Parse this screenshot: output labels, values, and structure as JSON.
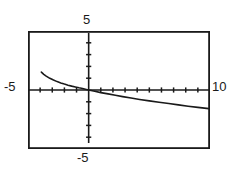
{
  "app": {
    "kind": "graphing-calculator-plot",
    "title": "Graphing calculator plot"
  },
  "labels": {
    "y_max": "5",
    "y_min": "-5",
    "x_min": "-5",
    "x_max": "10"
  },
  "colors": {
    "background": "#ffffff",
    "frame": "#1a1a1a",
    "axis": "#1a1a1a",
    "curve": "#1a1a1a",
    "text": "#1a1a1a"
  },
  "chart_data": {
    "type": "line",
    "title": "",
    "xlabel": "",
    "ylabel": "",
    "xlim": [
      -5,
      10
    ],
    "ylim": [
      -5,
      5
    ],
    "grid": false,
    "legend": "none",
    "axis_ticks": {
      "x_interval": 1,
      "y_interval": 1,
      "x_ticks": [
        -5,
        -4,
        -3,
        -2,
        -1,
        0,
        1,
        2,
        3,
        4,
        5,
        6,
        7,
        8,
        9,
        10
      ],
      "y_ticks": [
        -5,
        -4,
        -3,
        -2,
        -1,
        0,
        1,
        2,
        3,
        4,
        5
      ]
    },
    "series": [
      {
        "name": "curve",
        "description": "decreasing concave-down curve crossing near the origin",
        "x": [
          -3.9,
          -3.7,
          -3.5,
          -3.2,
          -2.9,
          -2.6,
          -2.3,
          -2.0,
          -1.7,
          -1.4,
          -1.1,
          -0.8,
          -0.5,
          -0.2,
          0.0,
          0.5,
          1.0,
          1.6,
          2.2,
          2.8,
          3.5,
          4.2,
          5.0,
          5.8,
          6.6,
          7.4,
          8.2,
          9.0,
          9.9
        ],
        "y": [
          1.52,
          1.33,
          1.18,
          0.99,
          0.84,
          0.71,
          0.6,
          0.5,
          0.41,
          0.33,
          0.26,
          0.19,
          0.13,
          0.05,
          0.0,
          -0.11,
          -0.22,
          -0.33,
          -0.45,
          -0.56,
          -0.68,
          -0.8,
          -0.92,
          -1.04,
          -1.15,
          -1.26,
          -1.37,
          -1.47,
          -1.58
        ]
      }
    ]
  },
  "geometry": {
    "frame": {
      "x": 28,
      "y": 31,
      "w": 182,
      "h": 118
    },
    "origin": {
      "x": 60.7,
      "y": 59.0
    },
    "px_per_unit_x": 12.13,
    "px_per_unit_y": 11.8
  }
}
